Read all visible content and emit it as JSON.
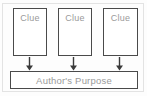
{
  "diagram": {
    "background_color": "#fdfdfd",
    "frame_color": "#e3e3e3",
    "box_border_color": "#4a4a4a",
    "text_color": "#9a9a9a",
    "arrow_color": "#3a3a3a",
    "clue_boxes": [
      {
        "label": "Clue"
      },
      {
        "label": "Clue"
      },
      {
        "label": "Clue"
      }
    ],
    "arrows": [
      {
        "name": "arrow-clue-1-to-purpose",
        "direction": "down"
      },
      {
        "name": "arrow-clue-2-to-purpose",
        "direction": "down"
      },
      {
        "name": "arrow-clue-3-to-purpose",
        "direction": "down"
      }
    ],
    "conclusion_box": {
      "label": "Author's Purpose"
    }
  }
}
